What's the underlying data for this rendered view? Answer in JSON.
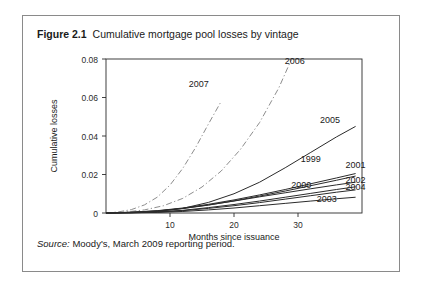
{
  "figure": {
    "number": "Figure 2.1",
    "title": "Cumulative mortgage pool losses by vintage",
    "source_label": "Source:",
    "source_text": " Moody's, March 2009 reporting period."
  },
  "chart_data": {
    "type": "line",
    "title": "Cumulative mortgage pool losses by vintage",
    "xlabel": "Months since issuance",
    "ylabel": "Cumulative losses",
    "xlim": [
      0,
      40
    ],
    "ylim": [
      0,
      0.08
    ],
    "xticks": [
      "10",
      "20",
      "30"
    ],
    "xtick_values": [
      10,
      20,
      30
    ],
    "yticks": [
      "0",
      "0.02",
      "0.04",
      "0.06",
      "0.08"
    ],
    "ytick_values": [
      0,
      0.02,
      0.04,
      0.06,
      0.08
    ],
    "grid": false,
    "legend": "inline-labels",
    "series": [
      {
        "name": "2007",
        "style": "dashdot",
        "label": "2007",
        "x": [
          0,
          2,
          4,
          6,
          8,
          10,
          12,
          14,
          16,
          18
        ],
        "values": [
          0,
          0.0006,
          0.0018,
          0.0042,
          0.0082,
          0.0145,
          0.0232,
          0.034,
          0.0462,
          0.058
        ]
      },
      {
        "name": "2006",
        "style": "dashdot",
        "label": "2006",
        "x": [
          0,
          3,
          6,
          9,
          12,
          15,
          18,
          21,
          24,
          27,
          29
        ],
        "values": [
          0,
          0.0005,
          0.0016,
          0.0038,
          0.0076,
          0.0135,
          0.0218,
          0.033,
          0.047,
          0.065,
          0.08
        ]
      },
      {
        "name": "2005",
        "style": "solid",
        "label": "2005",
        "x": [
          0,
          4,
          8,
          12,
          16,
          20,
          24,
          28,
          32,
          36,
          39
        ],
        "values": [
          0,
          0.0002,
          0.0008,
          0.0024,
          0.0055,
          0.01,
          0.016,
          0.0235,
          0.0315,
          0.0395,
          0.045
        ]
      },
      {
        "name": "1999",
        "style": "solid",
        "label": "1999",
        "x": [
          0,
          4,
          8,
          12,
          16,
          20,
          24,
          28,
          32,
          36,
          39
        ],
        "values": [
          0,
          0.0004,
          0.0012,
          0.0026,
          0.0045,
          0.0068,
          0.0094,
          0.0122,
          0.0152,
          0.0182,
          0.0205
        ]
      },
      {
        "name": "2001",
        "style": "solid",
        "label": "2001",
        "x": [
          0,
          4,
          8,
          12,
          16,
          20,
          24,
          28,
          32,
          36,
          39
        ],
        "values": [
          0,
          0.0003,
          0.001,
          0.0023,
          0.0041,
          0.0063,
          0.0088,
          0.0114,
          0.0142,
          0.017,
          0.0192
        ]
      },
      {
        "name": "2000",
        "style": "solid",
        "label": "2000",
        "x": [
          0,
          4,
          8,
          12,
          16,
          20,
          24,
          28,
          32,
          36,
          39
        ],
        "values": [
          0,
          0.0004,
          0.0011,
          0.0024,
          0.0042,
          0.0062,
          0.0084,
          0.0105,
          0.0126,
          0.0146,
          0.016
        ]
      },
      {
        "name": "2002",
        "style": "solid",
        "label": "2002",
        "x": [
          0,
          4,
          8,
          12,
          16,
          20,
          24,
          28,
          32,
          36,
          39
        ],
        "values": [
          0,
          0.0002,
          0.0006,
          0.0014,
          0.0028,
          0.0044,
          0.0062,
          0.0082,
          0.0102,
          0.0122,
          0.0136
        ]
      },
      {
        "name": "2004",
        "style": "solid",
        "label": "2004",
        "x": [
          0,
          4,
          8,
          12,
          16,
          20,
          24,
          28,
          32,
          36,
          39
        ],
        "values": [
          0,
          0.0001,
          0.0005,
          0.0012,
          0.0024,
          0.0038,
          0.0054,
          0.0072,
          0.009,
          0.0108,
          0.012
        ]
      },
      {
        "name": "2003",
        "style": "solid",
        "label": "2003",
        "x": [
          0,
          4,
          8,
          12,
          16,
          20,
          24,
          28,
          32,
          36,
          39
        ],
        "values": [
          0,
          0.0001,
          0.0003,
          0.0008,
          0.0016,
          0.0026,
          0.0038,
          0.005,
          0.0062,
          0.0074,
          0.0082
        ]
      }
    ],
    "annotations": [
      {
        "text": "2007",
        "x": 14.5,
        "y": 0.0655
      },
      {
        "text": "2006",
        "x": 29.5,
        "y": 0.0775
      },
      {
        "text": "2005",
        "x": 35.0,
        "y": 0.047
      },
      {
        "text": "1999",
        "x": 32.0,
        "y": 0.0265
      },
      {
        "text": "2001",
        "x": 39.0,
        "y": 0.0235
      },
      {
        "text": "2000",
        "x": 30.5,
        "y": 0.0132
      },
      {
        "text": "2002",
        "x": 39.0,
        "y": 0.0155
      },
      {
        "text": "2004",
        "x": 39.0,
        "y": 0.0118
      },
      {
        "text": "2003",
        "x": 34.5,
        "y": 0.0055
      }
    ]
  }
}
